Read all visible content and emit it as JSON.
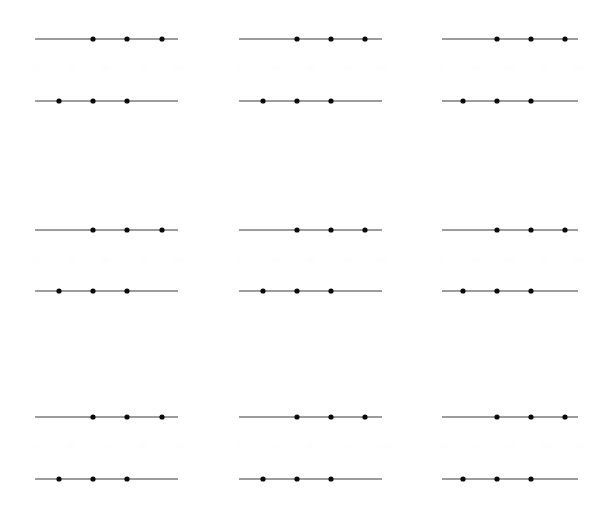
{
  "figure": {
    "title": "",
    "background_color": "#ffffff",
    "width": 613,
    "height": 511,
    "grid_rows": 3,
    "grid_cols": 3,
    "line_color": "#3a3a3a",
    "dot_color": "#0a0a0a",
    "ghost_label_color": "#fdfdfd"
  },
  "chart_data": {
    "type": "scatter",
    "title": "",
    "xlabel": "",
    "ylabel": "",
    "grid": false,
    "legend_position": "none",
    "layout": "3x3 small multiples, each panel holds two horizontal line-with-markers series",
    "xlim": [
      0,
      100
    ],
    "ylim": [
      0,
      2
    ],
    "series_names": [
      "upper-series",
      "lower-series"
    ],
    "panels": [
      {
        "panel_id": "panel-r1c1",
        "row": 0,
        "col": 0,
        "tick_labels": [
          "0",
          "25",
          "50",
          "75",
          "100"
        ],
        "series": [
          {
            "name": "upper-series",
            "y": 1,
            "line_x_start": 35,
            "line_x_end": 178,
            "x": [
              93,
              127,
              162
            ]
          },
          {
            "name": "lower-series",
            "y": 0,
            "line_x_start": 35,
            "line_x_end": 178,
            "x": [
              59,
              93,
              127
            ]
          }
        ]
      },
      {
        "panel_id": "panel-r1c2",
        "row": 0,
        "col": 1,
        "tick_labels": [
          "0",
          "25",
          "50",
          "75",
          "100"
        ],
        "series": [
          {
            "name": "upper-series",
            "y": 1,
            "line_x_start": 239,
            "line_x_end": 382,
            "x": [
              297,
              331,
              365
            ]
          },
          {
            "name": "lower-series",
            "y": 0,
            "line_x_start": 239,
            "line_x_end": 382,
            "x": [
              263,
              297,
              331
            ]
          }
        ]
      },
      {
        "panel_id": "panel-r1c3",
        "row": 0,
        "col": 2,
        "tick_labels": [
          "0",
          "25",
          "50",
          "75",
          "100"
        ],
        "series": [
          {
            "name": "upper-series",
            "y": 1,
            "line_x_start": 442,
            "line_x_end": 578,
            "x": [
              497,
              531,
              565
            ]
          },
          {
            "name": "lower-series",
            "y": 0,
            "line_x_start": 442,
            "line_x_end": 578,
            "x": [
              463,
              497,
              531
            ]
          }
        ]
      },
      {
        "panel_id": "panel-r2c1",
        "row": 1,
        "col": 0,
        "tick_labels": [
          "0",
          "25",
          "50",
          "75",
          "100"
        ],
        "series": [
          {
            "name": "upper-series",
            "y": 1,
            "line_x_start": 35,
            "line_x_end": 178,
            "x": [
              93,
              127,
              162
            ]
          },
          {
            "name": "lower-series",
            "y": 0,
            "line_x_start": 35,
            "line_x_end": 178,
            "x": [
              59,
              93,
              127
            ]
          }
        ]
      },
      {
        "panel_id": "panel-r2c2",
        "row": 1,
        "col": 1,
        "tick_labels": [
          "0",
          "25",
          "50",
          "75",
          "100"
        ],
        "series": [
          {
            "name": "upper-series",
            "y": 1,
            "line_x_start": 239,
            "line_x_end": 382,
            "x": [
              297,
              331,
              365
            ]
          },
          {
            "name": "lower-series",
            "y": 0,
            "line_x_start": 239,
            "line_x_end": 382,
            "x": [
              263,
              297,
              331
            ]
          }
        ]
      },
      {
        "panel_id": "panel-r2c3",
        "row": 1,
        "col": 2,
        "tick_labels": [
          "0",
          "25",
          "50",
          "75",
          "100"
        ],
        "series": [
          {
            "name": "upper-series",
            "y": 1,
            "line_x_start": 442,
            "line_x_end": 578,
            "x": [
              497,
              531,
              565
            ]
          },
          {
            "name": "lower-series",
            "y": 0,
            "line_x_start": 442,
            "line_x_end": 578,
            "x": [
              463,
              497,
              531
            ]
          }
        ]
      },
      {
        "panel_id": "panel-r3c1",
        "row": 2,
        "col": 0,
        "tick_labels": [
          "0",
          "25",
          "50",
          "75",
          "100"
        ],
        "series": [
          {
            "name": "upper-series",
            "y": 1,
            "line_x_start": 35,
            "line_x_end": 178,
            "x": [
              93,
              127,
              162
            ]
          },
          {
            "name": "lower-series",
            "y": 0,
            "line_x_start": 35,
            "line_x_end": 178,
            "x": [
              59,
              93,
              127
            ]
          }
        ]
      },
      {
        "panel_id": "panel-r3c2",
        "row": 2,
        "col": 1,
        "tick_labels": [
          "0",
          "25",
          "50",
          "75",
          "100"
        ],
        "series": [
          {
            "name": "upper-series",
            "y": 1,
            "line_x_start": 239,
            "line_x_end": 382,
            "x": [
              297,
              331,
              365
            ]
          },
          {
            "name": "lower-series",
            "y": 0,
            "line_x_start": 239,
            "line_x_end": 382,
            "x": [
              263,
              297,
              331
            ]
          }
        ]
      },
      {
        "panel_id": "panel-r3c3",
        "row": 2,
        "col": 2,
        "tick_labels": [
          "0",
          "25",
          "50",
          "75",
          "100"
        ],
        "series": [
          {
            "name": "upper-series",
            "y": 1,
            "line_x_start": 442,
            "line_x_end": 578,
            "x": [
              497,
              531,
              565
            ]
          },
          {
            "name": "lower-series",
            "y": 0,
            "line_x_start": 442,
            "line_x_end": 578,
            "x": [
              463,
              497,
              531
            ]
          }
        ]
      }
    ],
    "row_y_positions": [
      {
        "upper": 39,
        "lower": 101,
        "ghost_label_y": 69
      },
      {
        "upper": 230,
        "lower": 291,
        "ghost_label_y": 260
      },
      {
        "upper": 417,
        "lower": 479,
        "ghost_label_y": 447
      }
    ],
    "marker_radius": 2.6
  }
}
